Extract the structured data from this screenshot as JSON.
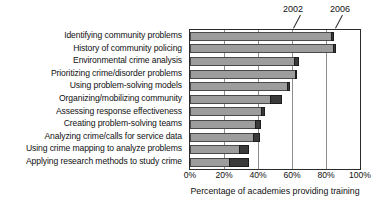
{
  "chart_data": {
    "type": "bar",
    "orientation": "horizontal",
    "stacked_overlay": true,
    "title": "",
    "xlabel": "Percentage of academies providing training",
    "ylabel": "",
    "xlim": [
      0,
      100
    ],
    "xticks": [
      "0%",
      "20%",
      "40%",
      "60%",
      "80%",
      "100%"
    ],
    "xtick_values": [
      0,
      20,
      40,
      60,
      80,
      100
    ],
    "grid": true,
    "grid_axis": "x",
    "legend_position": "annotation-top-right",
    "annotations": [
      {
        "label": "2002",
        "points_to": "light-gray-segment"
      },
      {
        "label": "2006",
        "points_to": "dark-segment"
      }
    ],
    "categories": [
      "Identifying community problems",
      "History of community policing",
      "Environmental crime analysis",
      "Prioritizing crime/disorder problems",
      "Using problem-solving models",
      "Organizing/mobilizing community",
      "Assessing response effectiveness",
      "Creating problem-solving teams",
      "Analyzing crime/calls for service data",
      "Using crime mapping to analyze problems",
      "Applying research methods to study crime"
    ],
    "series": [
      {
        "name": "2002",
        "color": "#9d9d9d",
        "values": [
          83,
          84,
          61,
          62,
          57,
          47,
          42,
          38,
          37,
          29,
          23
        ]
      },
      {
        "name": "2006",
        "color": "#3a3a3a",
        "values": [
          85,
          86,
          64,
          62,
          59,
          54,
          44,
          42,
          41,
          35,
          35
        ]
      }
    ]
  }
}
